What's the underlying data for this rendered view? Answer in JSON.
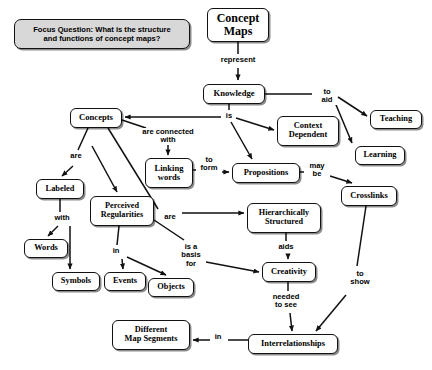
{
  "diagram": {
    "title_node": "Concept Maps",
    "focus_question": "Focus Question: What is the structure\nand functions of concept maps?",
    "colors": {
      "node_border": "#111111",
      "node_fill": "#ffffff",
      "focus_fill": "#d8d8d8",
      "edge": "#111111",
      "text": "#000000"
    },
    "nodes": [
      {
        "id": "focus",
        "label": "Focus Question: What is the structure\nand functions of concept maps?",
        "x": 14,
        "y": 19,
        "w": 176,
        "h": 30,
        "font": 7.6,
        "kind": "focus"
      },
      {
        "id": "concept_maps",
        "label": "Concept\nMaps",
        "x": 207,
        "y": 8,
        "w": 62,
        "h": 34,
        "font": 12,
        "kind": "node"
      },
      {
        "id": "knowledge",
        "label": "Knowledge",
        "x": 203,
        "y": 84,
        "w": 62,
        "h": 20,
        "font": 8.6,
        "kind": "node"
      },
      {
        "id": "teaching",
        "label": "Teaching",
        "x": 370,
        "y": 110,
        "w": 52,
        "h": 19,
        "font": 8.4,
        "kind": "node"
      },
      {
        "id": "learning",
        "label": "Learning",
        "x": 355,
        "y": 146,
        "w": 50,
        "h": 19,
        "font": 8.4,
        "kind": "node"
      },
      {
        "id": "context_dep",
        "label": "Context\nDependent",
        "x": 277,
        "y": 116,
        "w": 62,
        "h": 30,
        "font": 8.4,
        "kind": "node"
      },
      {
        "id": "concepts",
        "label": "Concepts",
        "x": 70,
        "y": 108,
        "w": 52,
        "h": 20,
        "font": 8.6,
        "kind": "node"
      },
      {
        "id": "linking",
        "label": "Linking\nwords",
        "x": 145,
        "y": 158,
        "w": 48,
        "h": 30,
        "font": 8.6,
        "kind": "node"
      },
      {
        "id": "propositions",
        "label": "Propositions",
        "x": 232,
        "y": 163,
        "w": 68,
        "h": 20,
        "font": 8.4,
        "kind": "node"
      },
      {
        "id": "crosslinks",
        "label": "Crosslinks",
        "x": 341,
        "y": 186,
        "w": 56,
        "h": 20,
        "font": 8.4,
        "kind": "node"
      },
      {
        "id": "labeled",
        "label": "Labeled",
        "x": 36,
        "y": 179,
        "w": 48,
        "h": 20,
        "font": 8.4,
        "kind": "node"
      },
      {
        "id": "perceived",
        "label": "Perceived\nRegularities",
        "x": 90,
        "y": 196,
        "w": 64,
        "h": 30,
        "font": 8.2,
        "kind": "node"
      },
      {
        "id": "hier",
        "label": "Hierarchically\nStructured",
        "x": 247,
        "y": 203,
        "w": 74,
        "h": 30,
        "font": 8.2,
        "kind": "node"
      },
      {
        "id": "words",
        "label": "Words",
        "x": 24,
        "y": 239,
        "w": 44,
        "h": 19,
        "font": 8.4,
        "kind": "node"
      },
      {
        "id": "symbols",
        "label": "Symbols",
        "x": 52,
        "y": 272,
        "w": 48,
        "h": 19,
        "font": 8.4,
        "kind": "node"
      },
      {
        "id": "events",
        "label": "Events",
        "x": 104,
        "y": 272,
        "w": 42,
        "h": 19,
        "font": 8.4,
        "kind": "node"
      },
      {
        "id": "objects",
        "label": "Objects",
        "x": 148,
        "y": 278,
        "w": 46,
        "h": 19,
        "font": 8.4,
        "kind": "node"
      },
      {
        "id": "creativity",
        "label": "Creativity",
        "x": 262,
        "y": 262,
        "w": 54,
        "h": 20,
        "font": 8.4,
        "kind": "node"
      },
      {
        "id": "interrel",
        "label": "Interrelationships",
        "x": 248,
        "y": 334,
        "w": 90,
        "h": 20,
        "font": 8.4,
        "kind": "node"
      },
      {
        "id": "segments",
        "label": "Different\nMap Segments",
        "x": 112,
        "y": 320,
        "w": 78,
        "h": 30,
        "font": 8.4,
        "kind": "node"
      }
    ],
    "link_labels": [
      {
        "id": "represent",
        "text": "represent",
        "x": 211,
        "y": 56,
        "w": 54,
        "font": 7.6
      },
      {
        "id": "to_aid",
        "text": "to\naid",
        "x": 317,
        "y": 88,
        "w": 20,
        "font": 7.6
      },
      {
        "id": "is",
        "text": "is",
        "x": 223,
        "y": 112,
        "w": 12,
        "font": 7.6
      },
      {
        "id": "are_conn",
        "text": "are connected\nwith",
        "x": 131,
        "y": 128,
        "w": 74,
        "font": 7.6
      },
      {
        "id": "to_form",
        "text": "to\nform",
        "x": 196,
        "y": 156,
        "w": 26,
        "font": 7.6
      },
      {
        "id": "may_be",
        "text": "may\nbe",
        "x": 304,
        "y": 162,
        "w": 26,
        "font": 7.6
      },
      {
        "id": "are_left",
        "text": "are",
        "x": 66,
        "y": 152,
        "w": 20,
        "font": 7.6
      },
      {
        "id": "with",
        "text": "with",
        "x": 50,
        "y": 214,
        "w": 24,
        "font": 7.6
      },
      {
        "id": "in",
        "text": "in",
        "x": 110,
        "y": 247,
        "w": 12,
        "font": 7.6
      },
      {
        "id": "are_right",
        "text": "are",
        "x": 160,
        "y": 213,
        "w": 20,
        "font": 7.6
      },
      {
        "id": "is_a_basis",
        "text": "is a\nbasis\nfor",
        "x": 178,
        "y": 243,
        "w": 26,
        "font": 7.6
      },
      {
        "id": "aids",
        "text": "aids",
        "x": 274,
        "y": 243,
        "w": 24,
        "font": 7.6
      },
      {
        "id": "to_show",
        "text": "to\nshow",
        "x": 346,
        "y": 270,
        "w": 28,
        "font": 7.6
      },
      {
        "id": "needed",
        "text": "needed\nto see",
        "x": 266,
        "y": 293,
        "w": 40,
        "font": 7.6
      },
      {
        "id": "in_bottom",
        "text": "in",
        "x": 212,
        "y": 333,
        "w": 12,
        "font": 7.6
      }
    ],
    "edges": [
      {
        "from": "concept_maps",
        "to": "knowledge",
        "label": "represent",
        "arrow": true
      },
      {
        "from": "knowledge",
        "to": "concepts",
        "label": "is",
        "arrow": true
      },
      {
        "from": "knowledge",
        "to": "context_dep",
        "label": "is",
        "arrow": true
      },
      {
        "from": "knowledge",
        "to": "propositions",
        "label": "is",
        "arrow": true
      },
      {
        "from": "knowledge",
        "to": "teaching",
        "label": "to aid",
        "arrow": true
      },
      {
        "from": "knowledge",
        "to": "learning",
        "label": "to aid",
        "arrow": true
      },
      {
        "from": "concepts",
        "to": "linking",
        "label": "are connected with",
        "arrow": true
      },
      {
        "from": "concepts",
        "to": "labeled",
        "label": "are",
        "arrow": true
      },
      {
        "from": "concepts",
        "to": "perceived",
        "label": "are",
        "arrow": true
      },
      {
        "from": "concepts",
        "to": "hier",
        "label": "are",
        "arrow": true
      },
      {
        "from": "linking",
        "to": "propositions",
        "label": "to form",
        "arrow": true
      },
      {
        "from": "propositions",
        "to": "crosslinks",
        "label": "may be",
        "arrow": true
      },
      {
        "from": "labeled",
        "to": "words",
        "label": "with",
        "arrow": true
      },
      {
        "from": "labeled",
        "to": "symbols",
        "label": "with",
        "arrow": true
      },
      {
        "from": "perceived",
        "to": "events",
        "label": "in",
        "arrow": true
      },
      {
        "from": "perceived",
        "to": "objects",
        "label": "in",
        "arrow": true
      },
      {
        "from": "perceived",
        "to": "creativity",
        "label": "is a basis for",
        "arrow": true
      },
      {
        "from": "hier",
        "to": "creativity",
        "label": "aids",
        "arrow": true
      },
      {
        "from": "crosslinks",
        "to": "interrel",
        "label": "to show",
        "arrow": true
      },
      {
        "from": "creativity",
        "to": "interrel",
        "label": "needed to see",
        "arrow": true
      },
      {
        "from": "interrel",
        "to": "segments",
        "label": "in",
        "arrow": true
      }
    ]
  }
}
